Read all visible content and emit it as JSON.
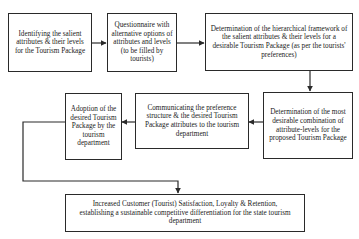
{
  "diagram": {
    "type": "flowchart",
    "boxes": [
      {
        "id": "b1",
        "text": "Identifying the salient attributes & their levels for the Tourism Package"
      },
      {
        "id": "b2",
        "text": "Questionnaire with alternative options of attributes and levels (to be filled by tourists)"
      },
      {
        "id": "b3",
        "text": "Determination of the hierarchical framework of the salient attributes & their levels for a desirable Tourism Package (as per the tourists' preferences)"
      },
      {
        "id": "b4",
        "text": "Determination of the most desirable combination of attribute-levels for the proposed Tourism Package"
      },
      {
        "id": "b5",
        "text": "Communicating the preference structure & the desired Tourism Package attributes to the tourism department"
      },
      {
        "id": "b6",
        "text": "Adoption of the desired Tourism Package by the tourism department"
      },
      {
        "id": "b7",
        "text": "Increased Customer (Tourist) Satisfaction, Loyalty & Retention, establishing a sustainable competitive differentiation for the state tourism department"
      }
    ],
    "edges": [
      {
        "from": "b1",
        "to": "b2"
      },
      {
        "from": "b2",
        "to": "b3"
      },
      {
        "from": "b3",
        "to": "b4"
      },
      {
        "from": "b4",
        "to": "b5"
      },
      {
        "from": "b5",
        "to": "b6"
      },
      {
        "from": "b6",
        "to": "b7"
      }
    ],
    "line_color": "#2a2a2a"
  }
}
